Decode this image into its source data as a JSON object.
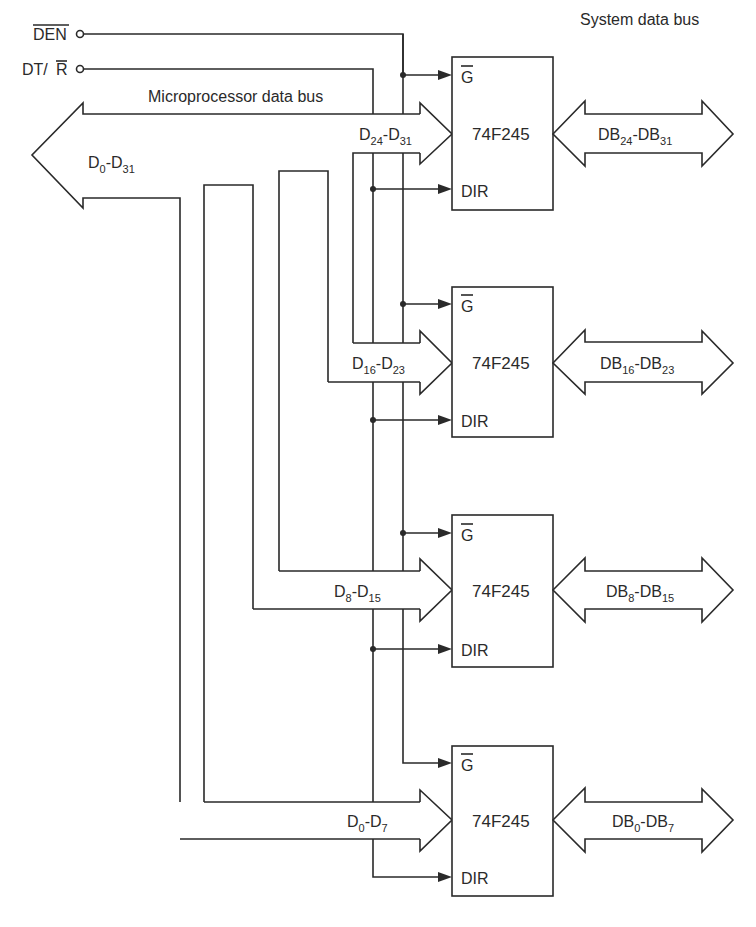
{
  "inputs": {
    "den": {
      "label": "DEN",
      "overbar": true
    },
    "dtr": {
      "label_prefix": "DT/",
      "label_bar": "R"
    }
  },
  "labels": {
    "microprocessor_bus": "Microprocessor data bus",
    "system_bus": "System data bus",
    "main_bus": {
      "base": "D",
      "from": "0",
      "to": "31"
    }
  },
  "transceivers": [
    {
      "chip": "74F245",
      "pin_g": "G",
      "pin_dir": "DIR",
      "in": {
        "base": "D",
        "from": "24",
        "to": "31"
      },
      "out": {
        "base": "DB",
        "from": "24",
        "to": "31"
      }
    },
    {
      "chip": "74F245",
      "pin_g": "G",
      "pin_dir": "DIR",
      "in": {
        "base": "D",
        "from": "16",
        "to": "23"
      },
      "out": {
        "base": "DB",
        "from": "16",
        "to": "23"
      }
    },
    {
      "chip": "74F245",
      "pin_g": "G",
      "pin_dir": "DIR",
      "in": {
        "base": "D",
        "from": "8",
        "to": "15"
      },
      "out": {
        "base": "DB",
        "from": "8",
        "to": "15"
      }
    },
    {
      "chip": "74F245",
      "pin_g": "G",
      "pin_dir": "DIR",
      "in": {
        "base": "D",
        "from": "0",
        "to": "7"
      },
      "out": {
        "base": "DB",
        "from": "0",
        "to": "7"
      }
    }
  ],
  "colors": {
    "ink": "#2a2a2a",
    "paper": "#ffffff"
  }
}
